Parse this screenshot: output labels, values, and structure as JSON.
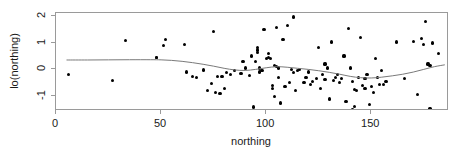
{
  "chart_data": {
    "type": "scatter",
    "title": "",
    "xlabel": "northing",
    "ylabel": "lo(northing)",
    "xlim": [
      0,
      187
    ],
    "ylim": [
      -1.55,
      2.1
    ],
    "xticks": [
      0,
      50,
      100,
      150
    ],
    "xtick_labels": [
      "0",
      "50",
      "100",
      "150"
    ],
    "yticks": [
      -1,
      0,
      1,
      2
    ],
    "ytick_labels": [
      "-1",
      "0",
      "1",
      "2"
    ],
    "grid": false,
    "legend": null,
    "point_color": "#000000",
    "smoother_color": "#7a7a7a",
    "frame_color": "#9a9a9a",
    "n_points": 115,
    "x": [
      6,
      27,
      33,
      48,
      48,
      51,
      52,
      61,
      62,
      65,
      67,
      70,
      72,
      74,
      75,
      76,
      77,
      78,
      79,
      80,
      81,
      83,
      85,
      88,
      89,
      90,
      92,
      93,
      94,
      95,
      96,
      96,
      96,
      97,
      97,
      98,
      99,
      100,
      101,
      101,
      102,
      103,
      103,
      104,
      104,
      105,
      105,
      106,
      106,
      107,
      108,
      109,
      110,
      111,
      112,
      113,
      113,
      114,
      115,
      116,
      118,
      119,
      120,
      121,
      122,
      124,
      125,
      126,
      127,
      128,
      128,
      129,
      130,
      131,
      132,
      133,
      134,
      135,
      136,
      137,
      138,
      139,
      140,
      141,
      141,
      142,
      142,
      143,
      144,
      145,
      146,
      147,
      147,
      148,
      149,
      150,
      151,
      152,
      153,
      154,
      155,
      156,
      157,
      162,
      166,
      170,
      172,
      174,
      175,
      176,
      177,
      178,
      178,
      179,
      182
    ],
    "y": [
      -0.2,
      -0.4,
      1.07,
      0.44,
      0.44,
      0.88,
      1.12,
      0.93,
      -0.1,
      -0.28,
      -0.3,
      -0.02,
      -0.78,
      -0.52,
      1.4,
      -0.85,
      -0.25,
      -0.9,
      -0.25,
      -0.7,
      -0.12,
      -0.2,
      -0.05,
      -0.15,
      0.28,
      0.05,
      -0.22,
      0.5,
      -1.4,
      0.3,
      0.62,
      0.72,
      0.82,
      0.05,
      -0.1,
      -0.05,
      1.5,
      0.4,
      0.45,
      0.6,
      0.42,
      -0.6,
      -0.72,
      -1.0,
      0.15,
      0.1,
      1.55,
      0.05,
      -0.3,
      -1.25,
      1.1,
      -0.65,
      1.62,
      -0.5,
      0.0,
      1.95,
      -0.12,
      -0.78,
      -0.05,
      0.0,
      -0.5,
      -0.3,
      -0.1,
      -0.55,
      -0.45,
      -0.35,
      0.82,
      -0.72,
      -0.2,
      -0.38,
      0.2,
      0.05,
      -1.1,
      1.02,
      -0.42,
      -0.3,
      -0.2,
      -0.5,
      -0.35,
      0.5,
      -1.2,
      1.52,
      0.05,
      -0.45,
      -1.48,
      -0.75,
      -1.38,
      -0.8,
      -0.3,
      1.18,
      -0.6,
      -0.35,
      -0.72,
      -0.2,
      -1.3,
      -0.65,
      -0.85,
      0.4,
      -0.3,
      -0.55,
      -0.05,
      -0.55,
      -0.45,
      1.02,
      -0.35,
      1.05,
      -0.95,
      1.15,
      0.92,
      1.78,
      0.2,
      0.15,
      -1.45,
      0.98,
      0.6
    ],
    "smoother": {
      "type": "loess",
      "x": [
        5,
        15,
        25,
        35,
        45,
        50,
        55,
        60,
        65,
        70,
        75,
        80,
        85,
        90,
        95,
        100,
        105,
        110,
        115,
        120,
        125,
        130,
        135,
        140,
        145,
        150,
        155,
        160,
        165,
        170,
        175,
        180,
        185
      ],
      "y": [
        0.35,
        0.35,
        0.355,
        0.36,
        0.36,
        0.355,
        0.335,
        0.3,
        0.25,
        0.19,
        0.12,
        0.04,
        -0.02,
        -0.04,
        0.0,
        0.06,
        0.1,
        0.08,
        0.04,
        0.0,
        -0.05,
        -0.11,
        -0.18,
        -0.26,
        -0.31,
        -0.32,
        -0.29,
        -0.24,
        -0.18,
        -0.1,
        0.0,
        0.1,
        0.17
      ]
    }
  }
}
